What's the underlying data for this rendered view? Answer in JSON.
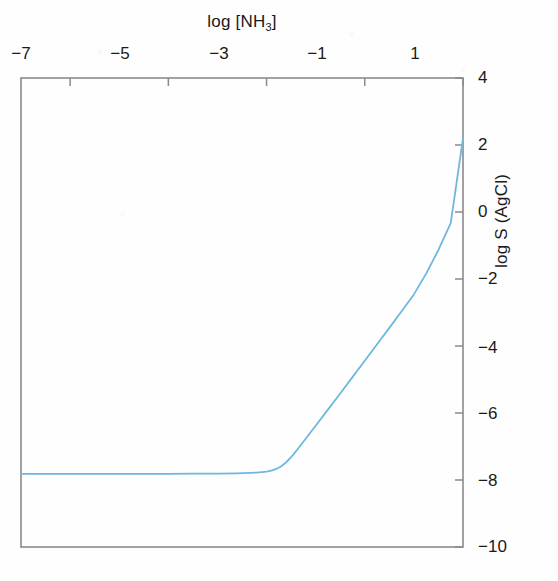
{
  "figure": {
    "background_color": "#fefefe",
    "axis_color": "#808080",
    "text_color": "#1a1a1a"
  },
  "axes": {
    "x_title_prefix": "log [NH",
    "x_title_subscript": "3",
    "x_title_suffix": "]",
    "x_title_full": "log [NH3]",
    "y_title": "log S (AgCl)",
    "x_tick_labels": [
      "−7",
      "−5",
      "−3",
      "−1",
      "1"
    ],
    "y_tick_labels": [
      "4",
      "2",
      "0",
      "−2",
      "−4",
      "−6",
      "−8",
      "−10"
    ],
    "x_axis_position": "top",
    "y_axis_position": "right"
  },
  "chart_data": {
    "type": "line",
    "title": "",
    "xlabel": "log [NH3]",
    "ylabel": "log S (AgCl)",
    "xlim": [
      -8.0,
      1.0
    ],
    "ylim": [
      -10,
      4
    ],
    "xticks": [
      -7,
      -5,
      -3,
      -1,
      1
    ],
    "yticks": [
      4,
      2,
      0,
      -2,
      -4,
      -6,
      -8,
      -10
    ],
    "grid": false,
    "legend": null,
    "line_color": "#6fb7e0",
    "line_width": 1.8,
    "series": [
      {
        "name": "log S (AgCl) vs log [NH3]",
        "x": [
          -8.0,
          -7.5,
          -7.0,
          -6.5,
          -6.0,
          -5.5,
          -5.0,
          -4.5,
          -4.0,
          -3.6,
          -3.2,
          -3.0,
          -2.9,
          -2.8,
          -2.7,
          -2.6,
          -2.5,
          -2.4,
          -2.2,
          -2.0,
          -1.75,
          -1.5,
          -1.25,
          -1.0,
          -0.75,
          -0.5,
          -0.25,
          0.0,
          0.25,
          0.5,
          0.75,
          1.0
        ],
        "y": [
          -7.82,
          -7.82,
          -7.82,
          -7.82,
          -7.82,
          -7.82,
          -7.82,
          -7.81,
          -7.81,
          -7.8,
          -7.78,
          -7.75,
          -7.72,
          -7.67,
          -7.59,
          -7.47,
          -7.32,
          -7.14,
          -6.76,
          -6.38,
          -5.9,
          -5.42,
          -4.93,
          -4.44,
          -3.95,
          -3.46,
          -2.96,
          -2.46,
          -1.84,
          -1.13,
          -0.33,
          2.2
        ]
      }
    ],
    "annotations": [
      {
        "text": "plateau region",
        "x_range": [
          -8.0,
          -2.8
        ],
        "y_value": -7.82
      },
      {
        "text": "slope ≈ 2 rise",
        "x_range": [
          -2.6,
          1.0
        ],
        "y_range": [
          -7.5,
          2.2
        ]
      }
    ]
  }
}
